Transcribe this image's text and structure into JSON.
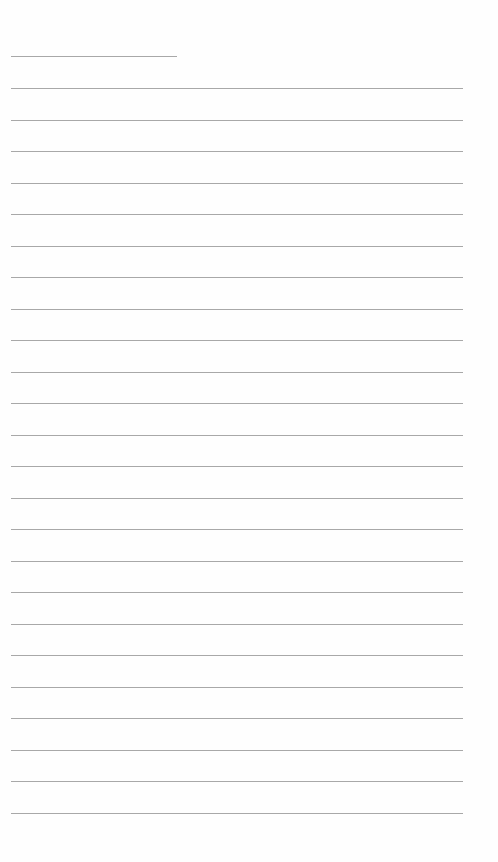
{
  "page": {
    "type": "lined-paper",
    "background": "#fefefe",
    "line_color": "#a8a8a8",
    "header_line": {
      "x": 11,
      "y": 56,
      "width": 166
    },
    "ruled_lines": {
      "count": 24,
      "x": 11,
      "first_y": 88,
      "spacing": 31.5,
      "width": 452
    }
  }
}
